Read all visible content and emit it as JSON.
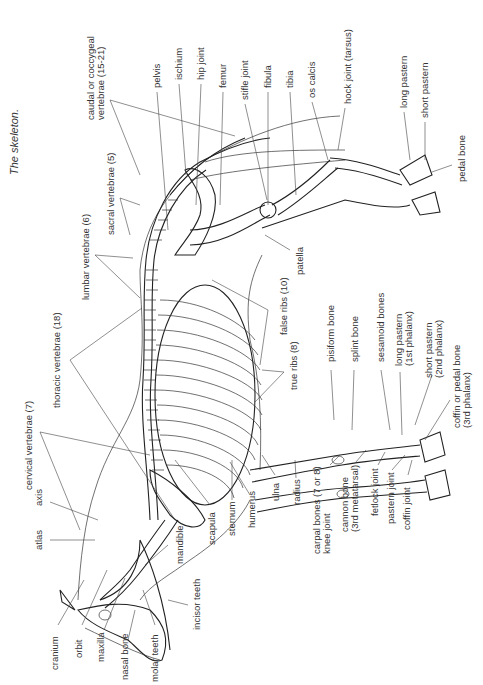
{
  "figure": {
    "title": "The skeleton.",
    "orientation": "rotated 90° counter-clockwise"
  },
  "labels": [
    {
      "id": "caudal",
      "lines": [
        "caudal or coccygeal",
        "vertebrae (15-21)"
      ],
      "x": 98,
      "y": 120
    },
    {
      "id": "pelvis",
      "lines": [
        "pelvis"
      ],
      "x": 157,
      "y": 88
    },
    {
      "id": "ischium",
      "lines": [
        "ischium"
      ],
      "x": 179,
      "y": 80
    },
    {
      "id": "hip-joint",
      "lines": [
        "hip joint"
      ],
      "x": 201,
      "y": 80
    },
    {
      "id": "femur",
      "lines": [
        "femur"
      ],
      "x": 223,
      "y": 88
    },
    {
      "id": "stifle-joint",
      "lines": [
        "stifle joint"
      ],
      "x": 245,
      "y": 80
    },
    {
      "id": "fibula",
      "lines": [
        "fibula"
      ],
      "x": 268,
      "y": 88
    },
    {
      "id": "tibia",
      "lines": [
        "tibia"
      ],
      "x": 290,
      "y": 88
    },
    {
      "id": "os-calcis",
      "lines": [
        "os calcis"
      ],
      "x": 312,
      "y": 88
    },
    {
      "id": "hock-joint",
      "lines": [
        "hock joint (tarsus)"
      ],
      "x": 351,
      "y": 80
    },
    {
      "id": "long-pastern-hind",
      "lines": [
        "long pastern"
      ],
      "x": 404,
      "y": 100
    },
    {
      "id": "short-pastern-hind",
      "lines": [
        "short pastern"
      ],
      "x": 425,
      "y": 112
    },
    {
      "id": "pedal-bone",
      "lines": [
        "pedal bone"
      ],
      "x": 462,
      "y": 182
    },
    {
      "id": "sacral",
      "lines": [
        "sacral vertebrae (5)"
      ],
      "x": 111,
      "y": 235
    },
    {
      "id": "lumbar",
      "lines": [
        "lumbar vertebrae (6)"
      ],
      "x": 89,
      "y": 300
    },
    {
      "id": "patella",
      "lines": [
        "patella"
      ],
      "x": 300,
      "y": 275
    },
    {
      "id": "false-ribs",
      "lines": [
        "false ribs (10)"
      ],
      "x": 284,
      "y": 335
    },
    {
      "id": "thoracic",
      "lines": [
        "thoracic vertebrae (18)"
      ],
      "x": 60,
      "y": 408
    },
    {
      "id": "pisiform",
      "lines": [
        "pisiform bone"
      ],
      "x": 334,
      "y": 362
    },
    {
      "id": "splint",
      "lines": [
        "splint bone"
      ],
      "x": 358,
      "y": 362
    },
    {
      "id": "sesamoid",
      "lines": [
        "sesamoid bones"
      ],
      "x": 384,
      "y": 362
    },
    {
      "id": "long-pastern-fore",
      "lines": [
        "long pastern",
        "(1st phalanx)"
      ],
      "x": 402,
      "y": 366
    },
    {
      "id": "true-ribs",
      "lines": [
        "true ribs (8)"
      ],
      "x": 297,
      "y": 390
    },
    {
      "id": "short-pastern-fore",
      "lines": [
        "short pastern",
        "(2nd phalanx)"
      ],
      "x": 432,
      "y": 378
    },
    {
      "id": "coffin-pedal",
      "lines": [
        "coffin or pedal bone",
        "(3rd phalanx)"
      ],
      "x": 462,
      "y": 428
    },
    {
      "id": "cervical",
      "lines": [
        "cervical vertebrae (7)"
      ],
      "x": 32,
      "y": 490
    },
    {
      "id": "axis",
      "lines": [
        "axis"
      ],
      "x": 42,
      "y": 506
    },
    {
      "id": "atlas",
      "lines": [
        "atlas"
      ],
      "x": 42,
      "y": 550
    },
    {
      "id": "mandible",
      "lines": [
        "mandible"
      ],
      "x": 183,
      "y": 564
    },
    {
      "id": "scapula",
      "lines": [
        "scapula"
      ],
      "x": 215,
      "y": 545
    },
    {
      "id": "sternum",
      "lines": [
        "sternum"
      ],
      "x": 235,
      "y": 536
    },
    {
      "id": "humerus",
      "lines": [
        "humerus"
      ],
      "x": 255,
      "y": 528
    },
    {
      "id": "ulna",
      "lines": [
        "ulna"
      ],
      "x": 279,
      "y": 501
    },
    {
      "id": "radius",
      "lines": [
        "radius"
      ],
      "x": 300,
      "y": 505
    },
    {
      "id": "carpal",
      "lines": [
        "carpal bones (7 or 8)",
        "knee joint"
      ],
      "x": 322,
      "y": 554
    },
    {
      "id": "cannon",
      "lines": [
        "cannon bone",
        "(3rd metatarsal)"
      ],
      "x": 350,
      "y": 532
    },
    {
      "id": "fetlock",
      "lines": [
        "fetlock joint"
      ],
      "x": 376,
      "y": 516
    },
    {
      "id": "pastern-joint",
      "lines": [
        "pastern joint"
      ],
      "x": 392,
      "y": 524
    },
    {
      "id": "coffin-joint",
      "lines": [
        "coffin joint"
      ],
      "x": 408,
      "y": 530
    },
    {
      "id": "incisor",
      "lines": [
        "incisor teeth"
      ],
      "x": 200,
      "y": 630
    },
    {
      "id": "cranium",
      "lines": [
        "cranium"
      ],
      "x": 58,
      "y": 670
    },
    {
      "id": "orbit",
      "lines": [
        "orbit"
      ],
      "x": 82,
      "y": 658
    },
    {
      "id": "maxilla",
      "lines": [
        "maxilla"
      ],
      "x": 104,
      "y": 662
    },
    {
      "id": "nasal-bone",
      "lines": [
        "nasal bone"
      ],
      "x": 128,
      "y": 680
    },
    {
      "id": "molar",
      "lines": [
        "molar teeth"
      ],
      "x": 158,
      "y": 682
    }
  ],
  "colors": {
    "ink": "#222222",
    "label": "#333333",
    "background": "#ffffff"
  }
}
